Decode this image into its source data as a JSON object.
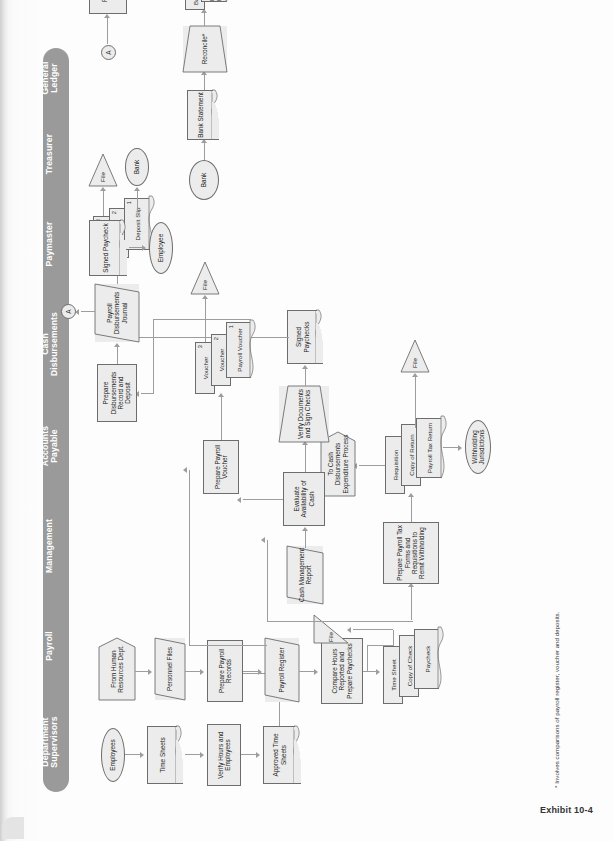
{
  "page": {
    "caption": "Exhibit 10-4",
    "footnote": "* Involves comparisons of payroll register, voucher and deposits."
  },
  "lanes": [
    {
      "id": "dept-supervisors",
      "lines": [
        "Department",
        "Supervisors"
      ]
    },
    {
      "id": "payroll",
      "lines": [
        "Payroll"
      ]
    },
    {
      "id": "management",
      "lines": [
        "Management"
      ]
    },
    {
      "id": "accounts-payable",
      "lines": [
        "Accounts",
        "Payable"
      ]
    },
    {
      "id": "cash-disbursements",
      "lines": [
        "Cash",
        "Disbursements"
      ]
    },
    {
      "id": "paymaster",
      "lines": [
        "Paymaster"
      ]
    },
    {
      "id": "treasurer",
      "lines": [
        "Treasurer"
      ]
    },
    {
      "id": "general-ledger",
      "lines": [
        "General",
        "Ledger"
      ]
    }
  ],
  "nodes": {
    "employees": "Employees",
    "time_sheets": "Time Sheets",
    "verify_hours": "Verify Hours and Employees",
    "approved_time_sheets": "Approved Time Sheets",
    "from_hr": "From Human Resources Dept.",
    "personnel_files": "Personnel Files",
    "prepare_payroll_records": "Prepare Payroll Records",
    "payroll_register": "Payroll Register",
    "compare_hours": "Compare Hours Reported and Prepare Paychecks",
    "time_sheet": "Time Sheet",
    "copy_of_check": "Copy of Check",
    "paycheck": "Paycheck",
    "file_payroll_1": "File",
    "prepare_tax_forms": "Prepare Payroll Tax Forms and Requisitions to Remit Withholding",
    "requisition": "Requisition",
    "copy_of_return": "Copy of Return",
    "payroll_tax_return": "Payroll Tax Return",
    "to_cash_disb": "To Cash Disbursements Expenditure Process",
    "withholding_jurisdictions": "Withholding Jurisdictions",
    "file_payroll_2": "File",
    "cash_mgmt_report": "Cash Management Report",
    "evaluate_cash": "Evaluate Availability of Cash",
    "verify_documents": "Verify Documents and Sign Checks",
    "signed_paychecks_mgmt": "Signed Paychecks",
    "prepare_payroll_voucher": "Prepare Payroll Voucher",
    "voucher_3": "Voucher",
    "voucher_2": "Voucher",
    "payroll_voucher_1": "Payroll Voucher",
    "file_ap": "File",
    "prepare_disbursements": "Prepare Disbursements Record and Deposit",
    "payroll_disb_journal": "Payroll Disbursements Journal",
    "conn_a_cd": "A",
    "voucher_cd_3": "Voucher",
    "deposit_cd_2": "Deposit",
    "deposit_slip_1": "Deposit Slip",
    "file_cd": "File",
    "bank_oval_cd": "Bank",
    "signed_paycheck_pm": "Signed Paycheck",
    "employee_pm": "Employee",
    "bank_oval_tr": "Bank",
    "bank_statement": "Bank Statement",
    "reconcile": "Reconcile*",
    "bank_statement_2": "Bank Statement",
    "bank_reconciliation": "Bank Reconciliation",
    "file_tr": "File",
    "conn_a_gl": "A",
    "reconcile_reports": "Reconcile Reports",
    "general_ledger_doc": "General Ledger"
  },
  "numbers": {
    "one": "1",
    "two": "2",
    "three": "3"
  },
  "colors": {
    "lane_bar": "#9a9a9a",
    "lane_text": "#ffffff",
    "node_fill": "#ececec",
    "node_stroke": "#6d6d6d",
    "arrow": "#9d9d9d",
    "page": "#fdfdfd"
  }
}
